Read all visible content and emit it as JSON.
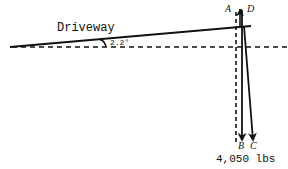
{
  "diagram": {
    "surface_label": "Driveway",
    "angle_label": "2.2°",
    "vector_labels": {
      "a": "A",
      "b": "B",
      "c": "C",
      "d": "D"
    },
    "weight_label": "4,050 lbs",
    "colors": {
      "line": "#111111",
      "background": "#ffffff"
    }
  }
}
